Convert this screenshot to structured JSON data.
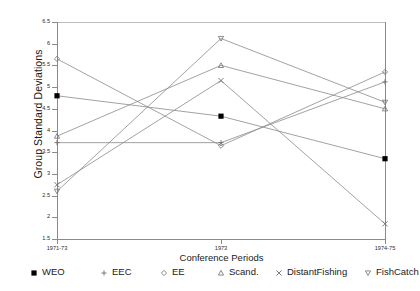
{
  "chart_data": {
    "type": "line",
    "title": "",
    "xlabel": "Conference Periods",
    "ylabel": "Group Standard Deviations",
    "categories": [
      "1971-73",
      "1973",
      "1974-75"
    ],
    "ylim": [
      1.5,
      6.5
    ],
    "yticks": [
      "1.5",
      "2",
      "2.5",
      "3",
      "3.5",
      "4",
      "4.5",
      "5",
      "5.5",
      "6",
      "6.5"
    ],
    "ytick_values": [
      1.5,
      2,
      2.5,
      3,
      3.5,
      4,
      4.5,
      5,
      5.5,
      6,
      6.5
    ],
    "grid": false,
    "legend_position": "bottom",
    "series": [
      {
        "name": "WEO",
        "marker": "filled-square",
        "values": [
          4.8,
          4.33,
          3.35
        ]
      },
      {
        "name": "EEC",
        "marker": "plus",
        "values": [
          3.72,
          3.72,
          5.12
        ]
      },
      {
        "name": "EE",
        "marker": "diamond",
        "values": [
          5.65,
          3.65,
          5.35
        ]
      },
      {
        "name": "Scand.",
        "marker": "triangle-up",
        "values": [
          3.87,
          5.5,
          4.5
        ]
      },
      {
        "name": "DistantFishing",
        "marker": "x-cross",
        "values": [
          2.75,
          5.15,
          1.85
        ]
      },
      {
        "name": "FishCatch",
        "marker": "triangle-down",
        "values": [
          2.6,
          6.12,
          4.65
        ]
      }
    ],
    "colors": {
      "line": "#8a8a8a",
      "marker": "#6e6e6e",
      "weo_marker": "#000000",
      "axis": "#8a8a8a",
      "text": "#1a1a1a",
      "background": "#ffffff"
    }
  },
  "legend": {
    "entries": [
      {
        "label": "WEO"
      },
      {
        "label": "EEC"
      },
      {
        "label": "EE"
      },
      {
        "label": "Scand."
      },
      {
        "label": "DistantFishing"
      },
      {
        "label": "FishCatch"
      }
    ]
  }
}
